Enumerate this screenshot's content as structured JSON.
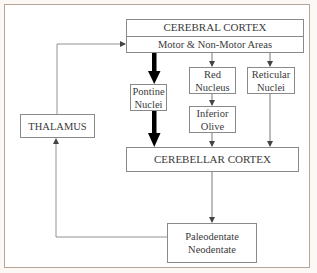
{
  "diagram": {
    "type": "flowchart",
    "nodes": {
      "cerebral_cortex": {
        "title": "CEREBRAL CORTEX",
        "subtitle": "Motor & Non-Motor Areas"
      },
      "pontine_nuclei": {
        "line1": "Pontine",
        "line2": "Nuclei"
      },
      "red_nucleus": {
        "line1": "Red",
        "line2": "Nucleus"
      },
      "reticular_nuclei": {
        "line1": "Reticular",
        "line2": "Nuclei"
      },
      "inferior_olive": {
        "line1": "Inferior",
        "line2": "Olive"
      },
      "thalamus": {
        "label": "THALAMUS"
      },
      "cerebellar_cortex": {
        "label": "CEREBELLAR CORTEX"
      },
      "deep_nuclei": {
        "line1": "Paleodentate",
        "line2": "Neodentate"
      }
    },
    "edges": [
      {
        "from": "cerebral_cortex",
        "to": "pontine_nuclei",
        "style": "thick"
      },
      {
        "from": "pontine_nuclei",
        "to": "cerebellar_cortex",
        "style": "thick"
      },
      {
        "from": "cerebral_cortex",
        "to": "red_nucleus",
        "style": "thin"
      },
      {
        "from": "cerebral_cortex",
        "to": "reticular_nuclei",
        "style": "thin"
      },
      {
        "from": "red_nucleus",
        "to": "inferior_olive",
        "style": "thin"
      },
      {
        "from": "inferior_olive",
        "to": "cerebellar_cortex",
        "style": "thin"
      },
      {
        "from": "reticular_nuclei",
        "to": "cerebellar_cortex",
        "style": "thin"
      },
      {
        "from": "cerebellar_cortex",
        "to": "deep_nuclei",
        "style": "thin"
      },
      {
        "from": "deep_nuclei",
        "to": "thalamus",
        "style": "thin"
      },
      {
        "from": "thalamus",
        "to": "cerebral_cortex",
        "style": "thin"
      }
    ],
    "colors": {
      "frame_border": "#b8a596",
      "box_border": "#8a8a8a",
      "line": "#555555",
      "thick_arrow": "#000000"
    }
  }
}
